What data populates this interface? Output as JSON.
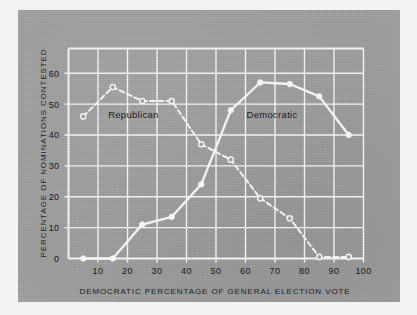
{
  "chart_data": {
    "type": "line",
    "title": "",
    "xlabel": "DEMOCRATIC PERCENTAGE OF GENERAL ELECTION VOTE",
    "ylabel": "PERCENTAGE OF NOMINATIONS CONTESTED",
    "xlim": [
      0,
      100
    ],
    "ylim": [
      0,
      68
    ],
    "xticks": [
      10,
      20,
      30,
      40,
      50,
      60,
      70,
      80,
      90,
      100
    ],
    "yticks": [
      0,
      10,
      20,
      30,
      40,
      50,
      60
    ],
    "grid": true,
    "legend_position": "inline-annotation",
    "x": [
      5,
      15,
      25,
      35,
      45,
      55,
      65,
      75,
      85,
      95
    ],
    "series": [
      {
        "name": "Republican",
        "style": "dashed",
        "marker": "open-circle",
        "color": "#f2f2f2",
        "values": [
          46,
          55.5,
          51,
          51,
          37,
          32,
          19.5,
          13,
          0.5,
          0.5
        ],
        "annotation": "Republican",
        "annotation_x": 22,
        "annotation_y": 45.5
      },
      {
        "name": "Democratic",
        "style": "solid",
        "marker": "filled-circle",
        "color": "#f4f4f4",
        "values": [
          0,
          0,
          11,
          13.5,
          24,
          48,
          57,
          56.5,
          52.5,
          40
        ],
        "annotation": "Democratic",
        "annotation_x": 69,
        "annotation_y": 45.5
      }
    ],
    "colors": {
      "background": "#9d9d9d",
      "grid": "#f0f0f0",
      "curve": "#f4f4f4",
      "text": "#1a1a1a",
      "page": "#f2f2f2"
    }
  }
}
